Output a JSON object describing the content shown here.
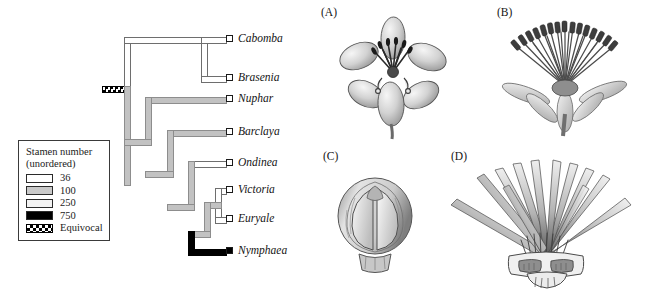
{
  "figure": {
    "legend": {
      "title_line1": "Stamen number",
      "title_line2": "(unordered)",
      "entries": [
        {
          "label": "36",
          "swatch": "white-open",
          "color": "#ffffff"
        },
        {
          "label": "100",
          "swatch": "gray-solid",
          "color": "#c9c9c9"
        },
        {
          "label": "250",
          "swatch": "light-stipple",
          "color": "#f2f2f2"
        },
        {
          "label": "750",
          "swatch": "black-solid",
          "color": "#000000"
        },
        {
          "label": "Equivocal",
          "swatch": "checkered",
          "color": "#000000"
        }
      ]
    },
    "tree": {
      "taxa": [
        {
          "name": "Cabomba",
          "marker": "open",
          "branch_state": "36"
        },
        {
          "name": "Brasenia",
          "marker": "open",
          "branch_state": "36"
        },
        {
          "name": "Nuphar",
          "marker": "open",
          "branch_state": "100"
        },
        {
          "name": "Barclaya",
          "marker": "open",
          "branch_state": "100"
        },
        {
          "name": "Ondinea",
          "marker": "open",
          "branch_state": "36"
        },
        {
          "name": "Victoria",
          "marker": "open",
          "branch_state": "36"
        },
        {
          "name": "Euryale",
          "marker": "open",
          "branch_state": "36"
        },
        {
          "name": "Nymphaea",
          "marker": "filled",
          "branch_state": "750"
        }
      ],
      "root_state": "Equivocal"
    },
    "panels": [
      {
        "id": "A",
        "label": "(A)"
      },
      {
        "id": "B",
        "label": "(B)"
      },
      {
        "id": "C",
        "label": "(C)"
      },
      {
        "id": "D",
        "label": "(D)"
      }
    ]
  }
}
